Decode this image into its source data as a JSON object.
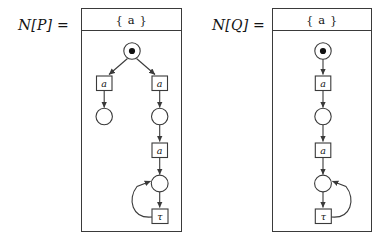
{
  "figure": {
    "background": "#ffffff",
    "stroke_color": "#3a3a3a",
    "text_color": "#141414"
  },
  "panels": [
    {
      "id": "net-p",
      "label_script": "N",
      "label_text": "[P]  =",
      "label_full": "ᵍN[P] =",
      "header_label": "{ a }",
      "nodes": {
        "p0": {
          "kind": "place",
          "marked": true,
          "token_label": "•"
        },
        "t_left": {
          "kind": "transition",
          "label": "a"
        },
        "t_right": {
          "kind": "transition",
          "label": "a"
        },
        "p_left": {
          "kind": "place",
          "marked": false
        },
        "p_right": {
          "kind": "place",
          "marked": false
        },
        "t_mid": {
          "kind": "transition",
          "label": "a"
        },
        "p_loop": {
          "kind": "place",
          "marked": false
        },
        "t_tau": {
          "kind": "transition",
          "label": "τ"
        }
      },
      "loop_direction": "left"
    },
    {
      "id": "net-q",
      "label_script": "N",
      "label_text": "[Q]  =",
      "label_full": "ᵍN[Q] =",
      "header_label": "{ a }",
      "nodes": {
        "p0": {
          "kind": "place",
          "marked": true,
          "token_label": "•"
        },
        "t_a1": {
          "kind": "transition",
          "label": "a"
        },
        "p1": {
          "kind": "place",
          "marked": false
        },
        "t_a2": {
          "kind": "transition",
          "label": "a"
        },
        "p_loop": {
          "kind": "place",
          "marked": false
        },
        "t_tau": {
          "kind": "transition",
          "label": "τ"
        }
      },
      "loop_direction": "right"
    }
  ]
}
